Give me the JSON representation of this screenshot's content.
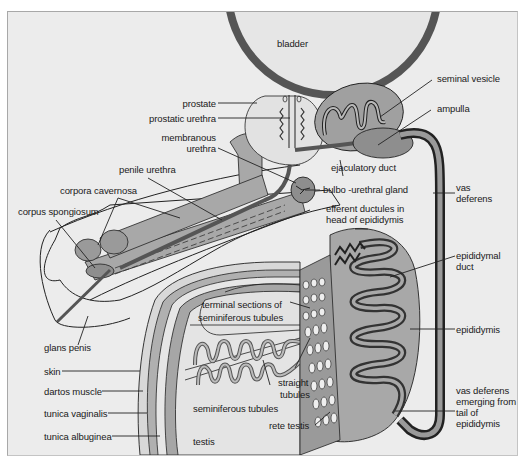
{
  "diagram": {
    "type": "anatomical",
    "colors": {
      "background": "#ececec",
      "organ_fill_light": "#e4e4e4",
      "organ_fill_mid": "#a6a6a6",
      "organ_fill_dark": "#8c8c8c",
      "duct_dark": "#555555",
      "outline": "#222222"
    }
  },
  "labels": {
    "bladder": "bladder",
    "seminal_vesicle": "seminal vesicle",
    "ampulla": "ampulla",
    "prostate": "prostate",
    "prostatic_urethra": "prostatic urethra",
    "membranous_urethra_1": "membranous",
    "membranous_urethra_2": "urethra",
    "penile_urethra": "penile urethra",
    "corpora_cavernosa": "corpora cavernosa",
    "corpus_spongiosum": "corpus spongiosum",
    "ejaculatory_duct": "ejaculatory duct",
    "bulbo_urethral_gland": "bulbo -urethral gland",
    "vas_deferens_1": "vas",
    "vas_deferens_2": "deferens",
    "efferent_ductules_1": "efferent ductules in",
    "efferent_ductules_2": "head of epididymis",
    "epididymal_duct_1": "epididymal",
    "epididymal_duct_2": "duct",
    "epididymis": "epididymis",
    "glans_penis": "glans penis",
    "terminal_sections_1": "terminal sections of",
    "terminal_sections_2": "seminiferous tubules",
    "skin": "skin",
    "dartos_muscle": "dartos muscle",
    "tunica_vaginalis": "tunica vaginalis",
    "tunica_albuginea": "tunica albuginea",
    "seminiferous_tubules": "seminiferous tubules",
    "straight_tubules_1": "straight",
    "straight_tubules_2": "tubules",
    "rete_testis": "rete testis",
    "testis": "testis",
    "vas_emerging_1": "vas deferens",
    "vas_emerging_2": "emerging from",
    "vas_emerging_3": "tail of",
    "vas_emerging_4": "epididymis"
  }
}
